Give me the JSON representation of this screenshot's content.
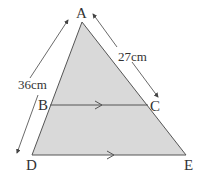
{
  "diagram": {
    "type": "similar-triangles",
    "fill_color": "#d9d9d9",
    "stroke_color": "#555555",
    "points": {
      "A": {
        "label": "A",
        "x": 82,
        "y": 22
      },
      "B": {
        "label": "B",
        "x": 50,
        "y": 105
      },
      "C": {
        "label": "C",
        "x": 148,
        "y": 105
      },
      "D": {
        "label": "D",
        "x": 32,
        "y": 155
      },
      "E": {
        "label": "E",
        "x": 186,
        "y": 155
      }
    },
    "measurements": {
      "AD": "36cm",
      "AC": "27cm"
    },
    "parallel_lines": [
      "BC",
      "DE"
    ]
  }
}
